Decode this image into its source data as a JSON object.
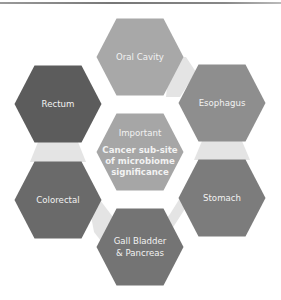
{
  "diagram": {
    "type": "hexagon-cluster",
    "center": {
      "title": "Important",
      "subtitle_lines": [
        "Cancer sub-site",
        "of microbiome",
        "significance"
      ],
      "color": "#a6a6a6"
    },
    "nodes": [
      {
        "id": "oral-cavity",
        "label_lines": [
          "Oral Cavity"
        ],
        "color": "#a8a8a8",
        "position": "top"
      },
      {
        "id": "esophagus",
        "label_lines": [
          "Esophagus"
        ],
        "color": "#8e8e8e",
        "position": "upper-right"
      },
      {
        "id": "stomach",
        "label_lines": [
          "Stomach"
        ],
        "color": "#7c7c7c",
        "position": "lower-right"
      },
      {
        "id": "gall-bladder-pancreas",
        "label_lines": [
          "Gall Bladder",
          "& Pancreas"
        ],
        "color": "#747474",
        "position": "bottom"
      },
      {
        "id": "colorectal",
        "label_lines": [
          "Colorectal"
        ],
        "color": "#6a6a6a",
        "position": "lower-left"
      },
      {
        "id": "rectum",
        "label_lines": [
          "Rectum"
        ],
        "color": "#5c5c5c",
        "position": "upper-left"
      }
    ],
    "connector_color": "#e4e4e4"
  }
}
